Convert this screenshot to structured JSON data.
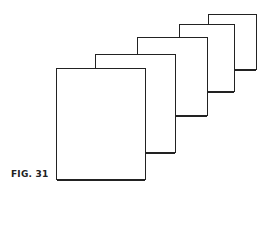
{
  "figure": {
    "caption": "FIG. 31",
    "line_color": "#222222",
    "background": "#ffffff",
    "sheets": [
      {
        "index": 1,
        "x": 208,
        "y": 14,
        "w": 49,
        "h": 56
      },
      {
        "index": 2,
        "x": 179,
        "y": 24,
        "w": 56,
        "h": 68
      },
      {
        "index": 3,
        "x": 137,
        "y": 37,
        "w": 71,
        "h": 79
      },
      {
        "index": 4,
        "x": 95,
        "y": 54,
        "w": 81,
        "h": 99
      },
      {
        "index": 5,
        "x": 56,
        "y": 68,
        "w": 90,
        "h": 112
      }
    ]
  }
}
